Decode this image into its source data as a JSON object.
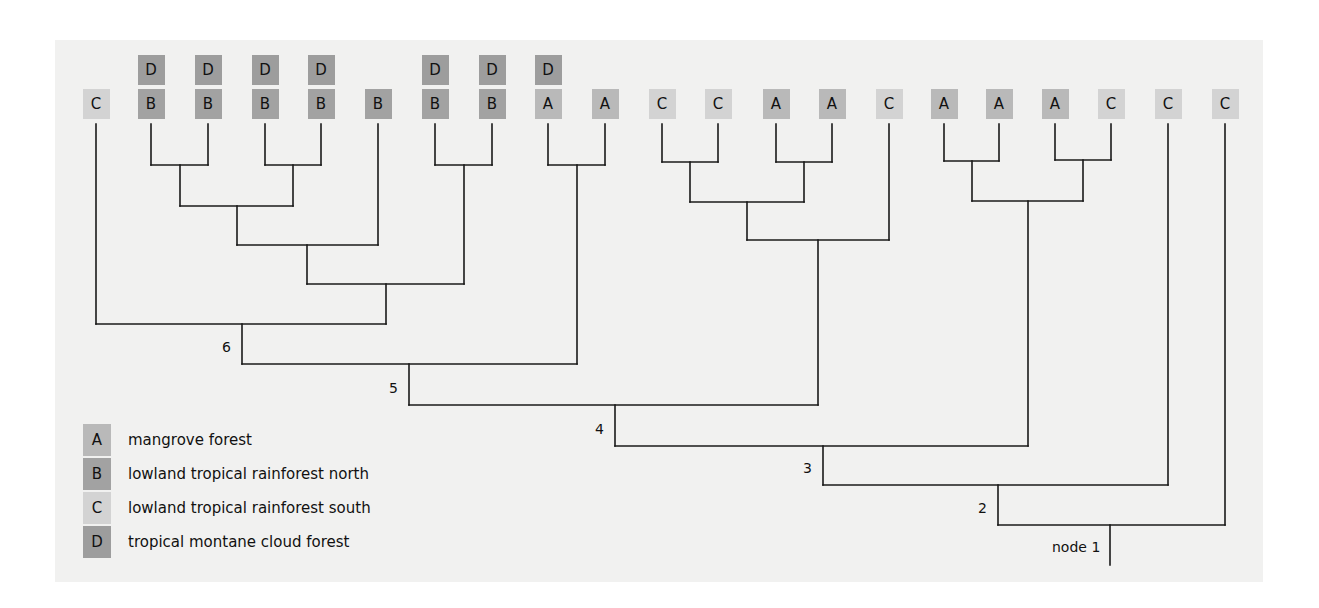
{
  "diagram": {
    "type": "cladogram",
    "colors": {
      "background": "#f1f1f0",
      "line": "#1a1a1a",
      "A": "#b9b9b9",
      "B": "#a2a2a2",
      "C": "#d3d3d3",
      "D": "#9d9d9d"
    },
    "leaves": [
      {
        "x": 96,
        "habitats": [
          "C"
        ]
      },
      {
        "x": 151,
        "habitats": [
          "B",
          "D"
        ]
      },
      {
        "x": 208,
        "habitats": [
          "B",
          "D"
        ]
      },
      {
        "x": 265,
        "habitats": [
          "B",
          "D"
        ]
      },
      {
        "x": 321,
        "habitats": [
          "B",
          "D"
        ]
      },
      {
        "x": 378,
        "habitats": [
          "B"
        ]
      },
      {
        "x": 435,
        "habitats": [
          "B",
          "D"
        ]
      },
      {
        "x": 492,
        "habitats": [
          "B",
          "D"
        ]
      },
      {
        "x": 548,
        "habitats": [
          "A",
          "D"
        ]
      },
      {
        "x": 605,
        "habitats": [
          "A"
        ]
      },
      {
        "x": 662,
        "habitats": [
          "C"
        ]
      },
      {
        "x": 718,
        "habitats": [
          "C"
        ]
      },
      {
        "x": 776,
        "habitats": [
          "A"
        ]
      },
      {
        "x": 832,
        "habitats": [
          "A"
        ]
      },
      {
        "x": 889,
        "habitats": [
          "C"
        ]
      },
      {
        "x": 944,
        "habitats": [
          "A"
        ]
      },
      {
        "x": 999,
        "habitats": [
          "A"
        ]
      },
      {
        "x": 1055,
        "habitats": [
          "A"
        ]
      },
      {
        "x": 1111,
        "habitats": [
          "C"
        ]
      },
      {
        "x": 1168,
        "habitats": [
          "C"
        ]
      },
      {
        "x": 1225,
        "habitats": [
          "C"
        ]
      }
    ],
    "joins": [
      {
        "x1": 151,
        "x2": 208,
        "y": 165
      },
      {
        "x1": 265,
        "x2": 321,
        "y": 165
      },
      {
        "x1": 180,
        "x2": 293,
        "y": 206
      },
      {
        "x1": 237,
        "x2": 378,
        "y": 245
      },
      {
        "x1": 435,
        "x2": 492,
        "y": 165
      },
      {
        "x1": 307,
        "x2": 464,
        "y": 284
      },
      {
        "x1": 96,
        "x2": 386,
        "y": 324
      },
      {
        "x1": 548,
        "x2": 605,
        "y": 165
      },
      {
        "x1": 242,
        "x2": 577,
        "y": 364
      },
      {
        "x1": 662,
        "x2": 718,
        "y": 162
      },
      {
        "x1": 776,
        "x2": 832,
        "y": 162
      },
      {
        "x1": 690,
        "x2": 804,
        "y": 202
      },
      {
        "x1": 747,
        "x2": 889,
        "y": 240
      },
      {
        "x1": 409,
        "x2": 818,
        "y": 405
      },
      {
        "x1": 944,
        "x2": 999,
        "y": 161
      },
      {
        "x1": 1055,
        "x2": 1111,
        "y": 160
      },
      {
        "x1": 972,
        "x2": 1083,
        "y": 201
      },
      {
        "x1": 615,
        "x2": 1028,
        "y": 446
      },
      {
        "x1": 823,
        "x2": 1168,
        "y": 485
      },
      {
        "x1": 998,
        "x2": 1225,
        "y": 525
      }
    ],
    "verticals": [
      {
        "x": 96,
        "y1": 124,
        "y2": 324
      },
      {
        "x": 151,
        "y1": 124,
        "y2": 165
      },
      {
        "x": 208,
        "y1": 124,
        "y2": 165
      },
      {
        "x": 265,
        "y1": 124,
        "y2": 165
      },
      {
        "x": 321,
        "y1": 124,
        "y2": 165
      },
      {
        "x": 180,
        "y1": 165,
        "y2": 206
      },
      {
        "x": 293,
        "y1": 165,
        "y2": 206
      },
      {
        "x": 378,
        "y1": 124,
        "y2": 245
      },
      {
        "x": 237,
        "y1": 206,
        "y2": 245
      },
      {
        "x": 435,
        "y1": 124,
        "y2": 165
      },
      {
        "x": 492,
        "y1": 124,
        "y2": 165
      },
      {
        "x": 464,
        "y1": 165,
        "y2": 284
      },
      {
        "x": 307,
        "y1": 245,
        "y2": 284
      },
      {
        "x": 386,
        "y1": 284,
        "y2": 324
      },
      {
        "x": 548,
        "y1": 124,
        "y2": 165
      },
      {
        "x": 605,
        "y1": 124,
        "y2": 165
      },
      {
        "x": 577,
        "y1": 165,
        "y2": 364
      },
      {
        "x": 242,
        "y1": 324,
        "y2": 364
      },
      {
        "x": 662,
        "y1": 124,
        "y2": 162
      },
      {
        "x": 718,
        "y1": 124,
        "y2": 162
      },
      {
        "x": 776,
        "y1": 124,
        "y2": 162
      },
      {
        "x": 832,
        "y1": 124,
        "y2": 162
      },
      {
        "x": 690,
        "y1": 162,
        "y2": 202
      },
      {
        "x": 804,
        "y1": 162,
        "y2": 202
      },
      {
        "x": 889,
        "y1": 124,
        "y2": 240
      },
      {
        "x": 747,
        "y1": 202,
        "y2": 240
      },
      {
        "x": 818,
        "y1": 240,
        "y2": 405
      },
      {
        "x": 409,
        "y1": 364,
        "y2": 405
      },
      {
        "x": 944,
        "y1": 124,
        "y2": 161
      },
      {
        "x": 999,
        "y1": 124,
        "y2": 161
      },
      {
        "x": 1055,
        "y1": 124,
        "y2": 160
      },
      {
        "x": 1111,
        "y1": 124,
        "y2": 160
      },
      {
        "x": 972,
        "y1": 161,
        "y2": 201
      },
      {
        "x": 1083,
        "y1": 160,
        "y2": 201
      },
      {
        "x": 1028,
        "y1": 201,
        "y2": 446
      },
      {
        "x": 615,
        "y1": 405,
        "y2": 446
      },
      {
        "x": 1168,
        "y1": 124,
        "y2": 485
      },
      {
        "x": 823,
        "y1": 446,
        "y2": 485
      },
      {
        "x": 1225,
        "y1": 124,
        "y2": 525
      },
      {
        "x": 998,
        "y1": 485,
        "y2": 525
      },
      {
        "x": 1110,
        "y1": 525,
        "y2": 565
      }
    ],
    "node_labels": [
      {
        "text": "6",
        "x": 222,
        "y": 339
      },
      {
        "text": "5",
        "x": 389,
        "y": 380
      },
      {
        "text": "4",
        "x": 595,
        "y": 421
      },
      {
        "text": "3",
        "x": 803,
        "y": 460
      },
      {
        "text": "2",
        "x": 978,
        "y": 500
      },
      {
        "text": "node 1",
        "x": 1052,
        "y": 539
      }
    ]
  },
  "legend": {
    "items": [
      {
        "key": "A",
        "label": "mangrove forest",
        "y": 424
      },
      {
        "key": "B",
        "label": "lowland tropical rainforest north",
        "y": 458
      },
      {
        "key": "C",
        "label": "lowland tropical rainforest south",
        "y": 492
      },
      {
        "key": "D",
        "label": "tropical montane cloud forest",
        "y": 526
      }
    ]
  }
}
